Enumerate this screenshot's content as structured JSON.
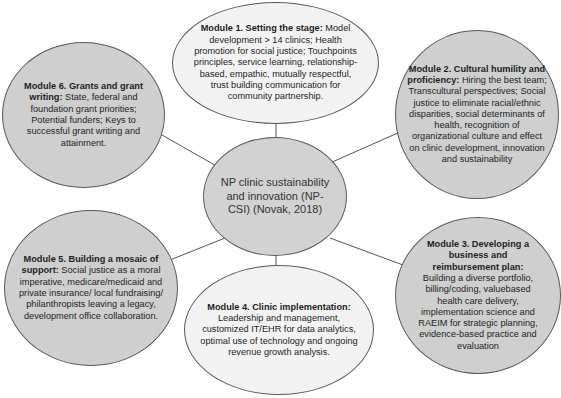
{
  "diagram": {
    "center": {
      "label": "NP clinic sustainability and innovation (NP-CSI) (Novak, 2018)"
    },
    "modules": [
      {
        "id": 1,
        "title": "Module 1. Setting the stage:",
        "body": " Model development > 14 clinics; Health promotion for social justice; Touchpoints principles, service learning, relationship-based, empathic, mutually respectful, trust building communication for community partnership.",
        "fill": "#f2f2f2"
      },
      {
        "id": 2,
        "title": "Module 2. Cultural humility and proficiency:",
        "body": " Hiring the best team; Transcultural perspectives; Social justice to eliminate racial/ethnic disparities, social determinants of health, recognition of organizational culture and effect on clinic development, innovation and sustainability",
        "fill": "#cfcfcf"
      },
      {
        "id": 3,
        "title": "Module 3. Developing a business and reimbursement plan:",
        "body": " Building a diverse portfolio, billing/coding, valuebased health care delivery, implementation science and RAEIM for strategic planning, evidence-based practice and evaluation",
        "fill": "#cfcfcf"
      },
      {
        "id": 4,
        "title": "Module 4. Clinic implementation:",
        "body": " Leadership and management, customized IT/EHR for data analytics, optimal use of technology and ongoing revenue growth analysis.",
        "fill": "#f2f2f2"
      },
      {
        "id": 5,
        "title": "Module 5. Building a mosaic of support:",
        "body": " Social justice as a moral imperative, medicare/medicaid and private insurance/ local fundraising/ philanthropists leaving a legacy, development office collaboration.",
        "fill": "#cfcfcf"
      },
      {
        "id": 6,
        "title": "Module 6. Grants and grant writing:",
        "body": " State, federal and foundation grant priorities; Potential funders; Keys to successful grant writing and attainment.",
        "fill": "#cfcfcf"
      }
    ]
  }
}
